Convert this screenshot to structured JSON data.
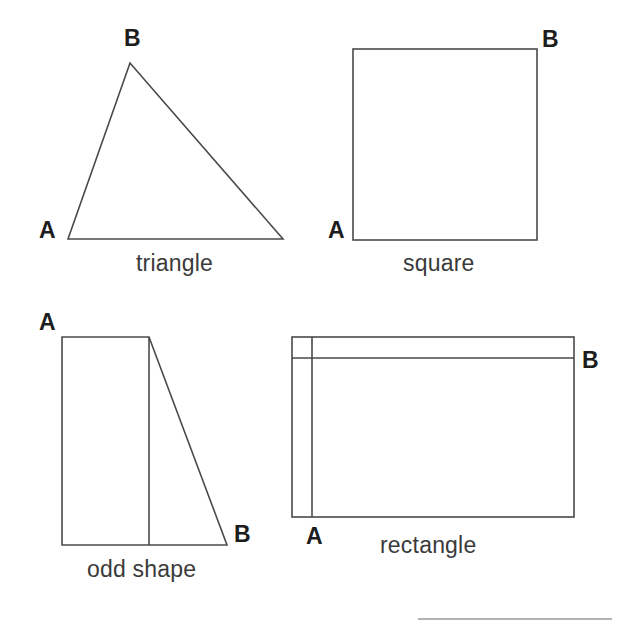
{
  "page": {
    "background_color": "#ffffff",
    "stroke_color": "#4a4a4a",
    "text_color": "#333333",
    "width": 630,
    "height": 644
  },
  "figures": [
    {
      "id": "triangle",
      "caption": "triangle",
      "type": "triangle",
      "vertex_labels": [
        "A",
        "B"
      ],
      "label_a": "A",
      "label_b": "B",
      "points": "68,239 130,63 283,239",
      "geometry": {
        "apex": [
          130,
          63
        ],
        "bottom_left": [
          68,
          239
        ],
        "bottom_right": [
          283,
          239
        ]
      }
    },
    {
      "id": "square",
      "caption": "square",
      "type": "square",
      "vertex_labels": [
        "A",
        "B"
      ],
      "label_a": "A",
      "label_b": "B",
      "geometry": {
        "left": 353,
        "top": 49,
        "right": 537,
        "bottom": 240
      }
    },
    {
      "id": "odd-shape",
      "caption": "odd shape",
      "type": "odd shape",
      "vertex_labels": [
        "A",
        "B"
      ],
      "label_a": "A",
      "label_b": "B",
      "points": "62,337 149,337 227,545 62,545",
      "geometry": {
        "top_left": [
          62,
          337
        ],
        "top_right": [
          149,
          337
        ],
        "bottom_right": [
          227,
          545
        ],
        "bottom_left": [
          62,
          545
        ],
        "inner_divider": [
          149,
          337,
          149,
          545
        ]
      }
    },
    {
      "id": "rectangle",
      "caption": "rectangle",
      "type": "rectangle",
      "vertex_labels": [
        "A",
        "B"
      ],
      "label_a": "A",
      "label_b": "B",
      "geometry": {
        "left": 292,
        "top": 337,
        "right": 574,
        "bottom": 517,
        "inner_vertical_x": 312,
        "inner_horizontal_y": 358
      }
    }
  ],
  "footer_rule": {
    "x1": 418,
    "x2": 612,
    "y": 619
  }
}
